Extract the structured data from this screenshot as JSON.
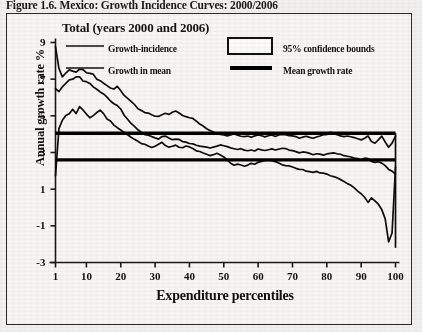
{
  "figure": {
    "caption": "Figure 1.6. Mexico: Growth Incidence Curves: 2000/2006",
    "panel_title": "Total (years 2000 and 2006)"
  },
  "legend": {
    "items": [
      {
        "label": "Growth-incidence",
        "marker": "thin-line"
      },
      {
        "label": "Growth in mean",
        "marker": "thin-line"
      },
      {
        "label": "95% confidence bounds",
        "marker": "open-rectangle"
      },
      {
        "label": "Mean growth rate",
        "marker": "thick-line"
      }
    ]
  },
  "chart_data": {
    "type": "line",
    "title": "Total (years 2000 and 2006)",
    "xlabel": "Expenditure percentiles",
    "ylabel": "Annual growth rate %",
    "xlim": [
      1,
      100
    ],
    "ylim": [
      -3,
      9
    ],
    "xticks": [
      1,
      10,
      20,
      30,
      40,
      50,
      60,
      70,
      80,
      90,
      100
    ],
    "yticks": [
      9,
      7,
      5,
      3,
      1,
      -1,
      -3
    ],
    "grid": false,
    "legend_position": "inside-top",
    "mean_growth_rate": 4.05,
    "growth_in_mean": 2.6,
    "x": [
      1,
      2,
      3,
      4,
      5,
      6,
      7,
      8,
      9,
      10,
      11,
      12,
      13,
      14,
      15,
      16,
      17,
      18,
      19,
      20,
      21,
      22,
      23,
      24,
      25,
      26,
      27,
      28,
      29,
      30,
      31,
      32,
      33,
      34,
      35,
      36,
      37,
      38,
      39,
      40,
      41,
      42,
      43,
      44,
      45,
      46,
      47,
      48,
      49,
      50,
      51,
      52,
      53,
      54,
      55,
      56,
      57,
      58,
      59,
      60,
      61,
      62,
      63,
      64,
      65,
      66,
      67,
      68,
      69,
      70,
      71,
      72,
      73,
      74,
      75,
      76,
      77,
      78,
      79,
      80,
      81,
      82,
      83,
      84,
      85,
      86,
      87,
      88,
      89,
      90,
      91,
      92,
      93,
      94,
      95,
      96,
      97,
      98,
      99,
      100
    ],
    "series": [
      {
        "name": "95% confidence upper bound",
        "values": [
          8.75,
          7.6,
          7.15,
          7.35,
          7.5,
          7.45,
          7.4,
          7.55,
          7.5,
          7.35,
          7.3,
          7.25,
          7.0,
          6.9,
          6.8,
          6.65,
          6.5,
          6.45,
          6.6,
          6.35,
          6.1,
          5.95,
          5.8,
          5.6,
          5.4,
          5.3,
          5.2,
          5.15,
          5.05,
          5.0,
          4.95,
          5.05,
          5.15,
          5.1,
          5.2,
          5.25,
          5.15,
          5.0,
          4.95,
          4.9,
          4.85,
          4.7,
          4.55,
          4.45,
          4.3,
          4.2,
          4.1,
          4.05,
          4.0,
          3.95,
          3.9,
          3.95,
          4.0,
          3.95,
          3.9,
          3.85,
          3.9,
          3.85,
          3.9,
          3.95,
          3.9,
          3.85,
          3.9,
          3.95,
          3.9,
          3.95,
          4.0,
          3.95,
          3.9,
          3.9,
          3.85,
          3.8,
          3.85,
          3.9,
          3.85,
          3.8,
          3.85,
          3.9,
          3.95,
          4.0,
          4.1,
          4.05,
          3.95,
          3.9,
          3.85,
          3.9,
          3.85,
          3.8,
          3.75,
          3.7,
          3.8,
          3.9,
          3.6,
          3.5,
          3.7,
          3.9,
          3.6,
          3.3,
          3.5,
          3.9
        ]
      },
      {
        "name": "Growth-incidence curve",
        "values": [
          6.5,
          6.3,
          6.6,
          6.8,
          6.95,
          7.0,
          7.1,
          7.15,
          6.9,
          6.85,
          6.75,
          6.6,
          6.45,
          6.3,
          6.2,
          6.0,
          5.8,
          5.65,
          5.55,
          5.35,
          5.05,
          4.8,
          4.6,
          4.4,
          4.25,
          4.1,
          4.0,
          3.95,
          3.85,
          3.8,
          3.75,
          3.85,
          3.9,
          3.8,
          3.7,
          3.75,
          3.7,
          3.6,
          3.55,
          3.5,
          3.45,
          3.4,
          3.35,
          3.3,
          3.3,
          3.25,
          3.3,
          3.35,
          3.4,
          3.35,
          3.3,
          3.25,
          3.2,
          3.15,
          3.2,
          3.15,
          3.1,
          3.15,
          3.1,
          3.2,
          3.15,
          3.1,
          3.15,
          3.2,
          3.15,
          3.2,
          3.25,
          3.2,
          3.15,
          3.1,
          3.05,
          3.0,
          3.05,
          3.0,
          2.95,
          2.9,
          2.95,
          2.9,
          2.85,
          2.9,
          2.95,
          3.0,
          2.95,
          2.9,
          2.85,
          2.8,
          2.75,
          2.7,
          2.65,
          2.6,
          2.7,
          2.65,
          2.5,
          2.45,
          2.5,
          2.4,
          2.3,
          2.1,
          2.0,
          1.8
        ]
      },
      {
        "name": "95% confidence lower bound",
        "values": [
          1.75,
          4.3,
          4.75,
          5.0,
          5.1,
          5.35,
          5.15,
          5.5,
          5.3,
          5.1,
          4.9,
          5.0,
          5.2,
          5.3,
          5.1,
          4.85,
          4.7,
          4.5,
          4.35,
          4.25,
          4.1,
          3.95,
          3.85,
          3.7,
          3.6,
          3.5,
          3.45,
          3.35,
          3.3,
          3.35,
          3.45,
          3.55,
          3.4,
          3.3,
          3.35,
          3.4,
          3.3,
          3.25,
          3.35,
          3.3,
          3.2,
          3.1,
          3.05,
          2.95,
          2.9,
          2.85,
          2.9,
          2.95,
          2.85,
          2.75,
          2.6,
          2.4,
          2.3,
          2.35,
          2.3,
          2.25,
          2.3,
          2.4,
          2.35,
          2.45,
          2.5,
          2.55,
          2.6,
          2.55,
          2.5,
          2.45,
          2.35,
          2.3,
          2.25,
          2.2,
          2.15,
          2.1,
          2.05,
          2.0,
          1.95,
          1.9,
          1.95,
          1.9,
          1.85,
          1.8,
          1.75,
          1.7,
          1.6,
          1.5,
          1.4,
          1.3,
          1.2,
          1.05,
          0.9,
          0.75,
          0.55,
          0.3,
          0.55,
          0.35,
          0.2,
          -0.1,
          -0.6,
          -1.9,
          -1.4,
          2.2
        ]
      }
    ]
  },
  "axes": {
    "y_tick_labels": [
      "9",
      "7",
      "5",
      "3",
      "1",
      "-1",
      "-3"
    ],
    "x_tick_labels": [
      "1",
      "10",
      "20",
      "30",
      "40",
      "50",
      "60",
      "70",
      "80",
      "90",
      "100"
    ],
    "y_title": "Annual growth rate %",
    "x_title": "Expenditure percentiles"
  }
}
